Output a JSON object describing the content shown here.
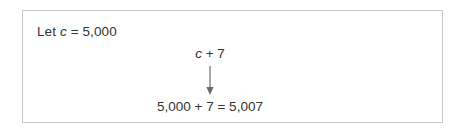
{
  "figure": {
    "border_color": "#c9c9c9",
    "background_color": "#ffffff",
    "text_color": "#333333",
    "arrow_color": "#6b6b6b"
  },
  "panel": {
    "declaration": {
      "prefix": "Let ",
      "variable": "c",
      "assignment": " = 5,000",
      "full_text": "Let c = 5,000"
    },
    "expression": {
      "variable": "c",
      "operator_and_operand": " + 7",
      "full_text": "c + 7"
    },
    "arrow": {
      "icon": "down-arrow-icon",
      "direction": "down"
    },
    "result": {
      "full_text": "5,000 + 7 = 5,007"
    }
  }
}
